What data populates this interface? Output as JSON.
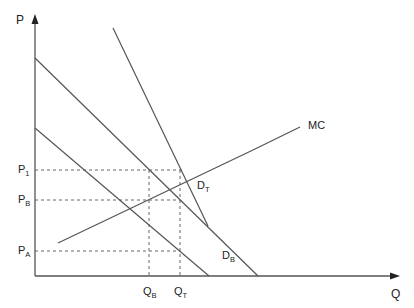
{
  "diagram": {
    "axes": {
      "y_label": "P",
      "x_label": "Q"
    },
    "curves": {
      "mc": "MC",
      "d_t": {
        "base": "D",
        "sub": "T"
      },
      "d_b": {
        "base": "D",
        "sub": "B"
      }
    },
    "price_levels": {
      "p1": {
        "base": "P",
        "sub": "1"
      },
      "pb": {
        "base": "P",
        "sub": "B"
      },
      "pa": {
        "base": "P",
        "sub": "A"
      }
    },
    "quantity_levels": {
      "qb": {
        "base": "Q",
        "sub": "B"
      },
      "qt": {
        "base": "Q",
        "sub": "T"
      }
    },
    "colors": {
      "line": "#555555",
      "text": "#222222",
      "background": "#ffffff"
    }
  }
}
